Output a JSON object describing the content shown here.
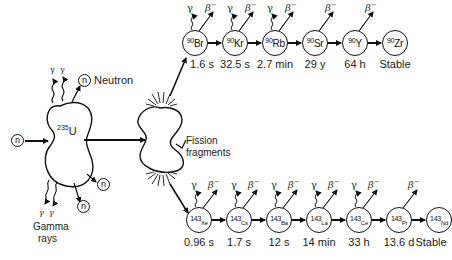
{
  "labels": {
    "neutron": "Neutron",
    "fission_fragments_line1": "Fission",
    "fission_fragments_line2": "fragments",
    "gamma_rays_line1": "Gamma",
    "gamma_rays_line2": "rays",
    "n": "n",
    "gamma": "γ",
    "beta": "β",
    "beta_sup": "−"
  },
  "parent": {
    "mass": "235",
    "symbol": "U"
  },
  "chains": [
    {
      "name": "mass-90",
      "nuclides": [
        {
          "mass": "90",
          "symbol": "Br",
          "half_life": "1.6 s",
          "gamma": true,
          "beta": true
        },
        {
          "mass": "90",
          "symbol": "Kr",
          "half_life": "32.5 s",
          "gamma": true,
          "beta": true
        },
        {
          "mass": "90",
          "symbol": "Rb",
          "half_life": "2.7 min",
          "gamma": true,
          "beta": true
        },
        {
          "mass": "90",
          "symbol": "Sr",
          "half_life": "29 y",
          "gamma": false,
          "beta": true
        },
        {
          "mass": "90",
          "symbol": "Y",
          "half_life": "64 h",
          "gamma": false,
          "beta": true
        },
        {
          "mass": "90",
          "symbol": "Zr",
          "half_life": "Stable",
          "gamma": false,
          "beta": false
        }
      ]
    },
    {
      "name": "mass-143",
      "nuclides": [
        {
          "mass": "143",
          "symbol": "Xe",
          "half_life": "0.96 s",
          "gamma": true,
          "beta": true
        },
        {
          "mass": "143",
          "symbol": "Cs",
          "half_life": "1.7 s",
          "gamma": true,
          "beta": true
        },
        {
          "mass": "143",
          "symbol": "Ba",
          "half_life": "12 s",
          "gamma": true,
          "beta": true
        },
        {
          "mass": "143",
          "symbol": "La",
          "half_life": "14 min",
          "gamma": true,
          "beta": true
        },
        {
          "mass": "143",
          "symbol": "Ce",
          "half_life": "33 h",
          "gamma": true,
          "beta": true
        },
        {
          "mass": "143",
          "symbol": "Pr",
          "half_life": "13.6 d",
          "gamma": false,
          "beta": true
        },
        {
          "mass": "143",
          "symbol": "Nd",
          "half_life": "Stable",
          "gamma": false,
          "beta": false
        }
      ]
    }
  ]
}
